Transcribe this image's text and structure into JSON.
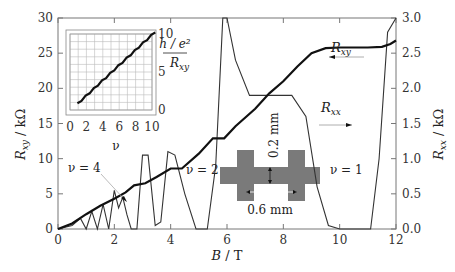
{
  "chart_data": {
    "type": "line",
    "title": "",
    "xlabel": "B / T",
    "ylabel_left": "R_xy / kΩ",
    "ylabel_right": "R_xx / kΩ",
    "xlim": [
      0,
      12
    ],
    "ylim_left": [
      0,
      30
    ],
    "ylim_right": [
      0,
      3.0
    ],
    "x_ticks": [
      "0",
      "2",
      "4",
      "6",
      "8",
      "10",
      "12"
    ],
    "y_ticks_left": [
      "0",
      "5",
      "10",
      "15",
      "20",
      "25",
      "30"
    ],
    "y_ticks_right": [
      "0.0",
      "0.5",
      "1.0",
      "1.5",
      "2.0",
      "2.5",
      "3.0"
    ],
    "grid": false,
    "series": [
      {
        "name": "R_xy",
        "axis": "left",
        "x": [
          0,
          0.5,
          1.0,
          1.5,
          2.0,
          2.4,
          2.7,
          3.1,
          3.5,
          4.0,
          4.4,
          5.0,
          5.5,
          5.9,
          6.3,
          7.0,
          7.5,
          8.0,
          8.5,
          9.0,
          9.5,
          10.0,
          11.0,
          11.5,
          11.8,
          12.0
        ],
        "values": [
          0,
          0.8,
          2.1,
          3.3,
          4.3,
          5.2,
          6.2,
          6.5,
          7.4,
          8.6,
          8.6,
          10.7,
          12.9,
          12.9,
          14.6,
          17.1,
          19.3,
          21.0,
          23.1,
          25.0,
          25.7,
          25.8,
          25.8,
          25.9,
          26.3,
          26.8
        ]
      },
      {
        "name": "R_xx",
        "axis": "right",
        "x": [
          0,
          0.5,
          0.8,
          1.0,
          1.2,
          1.4,
          1.6,
          1.8,
          2.0,
          2.15,
          2.3,
          2.45,
          2.6,
          2.8,
          3.0,
          3.2,
          3.45,
          3.65,
          3.9,
          4.15,
          4.5,
          4.9,
          5.3,
          5.6,
          5.85,
          6.0,
          6.3,
          6.8,
          7.2,
          7.8,
          8.3,
          8.8,
          9.2,
          9.6,
          10.0,
          10.6,
          11.1,
          11.4,
          11.7,
          12.0
        ],
        "values": [
          0,
          0.05,
          0.15,
          0.0,
          0.25,
          0.0,
          0.35,
          0.0,
          0.55,
          0.3,
          0.45,
          0.2,
          0.0,
          0.0,
          1.05,
          1.05,
          0.05,
          0.1,
          1.1,
          1.05,
          0.5,
          0.0,
          0.0,
          0.9,
          3.2,
          3.5,
          2.4,
          1.9,
          1.9,
          1.9,
          1.9,
          1.6,
          0.6,
          0.05,
          0.0,
          0.0,
          0.0,
          1.0,
          2.8,
          3.2
        ]
      }
    ],
    "annotations": [
      "R_xy ←",
      "R_xx →",
      "ν = 4",
      "ν = 2",
      "ν = 1",
      "0.2 mm",
      "0.6 mm"
    ],
    "inset": {
      "type": "line",
      "xlabel": "ν",
      "ylabel": "(h/e²) / R_xy",
      "xlim": [
        0,
        10
      ],
      "ylim": [
        0,
        10
      ],
      "x_ticks": [
        "0",
        "2",
        "4",
        "6",
        "8",
        "10"
      ],
      "y_ticks": [
        "0",
        "5",
        "10"
      ],
      "grid": true,
      "x": [
        1,
        2,
        3,
        4,
        5,
        6,
        7,
        8,
        9,
        10
      ],
      "values": [
        1,
        2,
        3,
        4,
        5,
        6,
        7,
        8,
        9,
        10
      ]
    }
  },
  "labels": {
    "x_axis": "B / T",
    "y_left_main": "R",
    "y_left_sub": "xy",
    "y_left_unit": " / kΩ",
    "y_right_main": "R",
    "y_right_sub": "xx",
    "y_right_unit": " / kΩ",
    "rxy_tag_main": "R",
    "rxy_tag_sub": "xy",
    "rxx_tag_main": "R",
    "rxx_tag_sub": "xx",
    "nu4": "ν = 4",
    "nu2": "ν = 2",
    "nu1": "ν = 1",
    "dim_vertical": "0.2 mm",
    "dim_horizontal": "0.6 mm",
    "inset_xlabel": "ν",
    "inset_ylabel_num": "h / e²",
    "inset_ylabel_den_main": "R",
    "inset_ylabel_den_sub": "xy"
  },
  "colors": {
    "rxy_line": "#111111",
    "rxx_line": "#333333",
    "axis": "#666666",
    "device": "#7a7a7a",
    "grid": "#bbbbbb"
  }
}
